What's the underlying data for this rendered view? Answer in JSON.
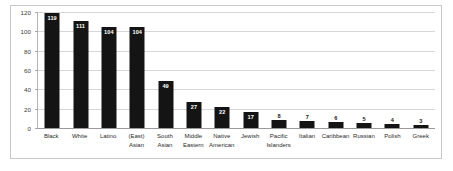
{
  "chart_data": {
    "type": "bar",
    "title": "",
    "xlabel": "",
    "ylabel": "",
    "ylim": [
      0,
      120
    ],
    "yticks": [
      0,
      20,
      40,
      60,
      80,
      100,
      120
    ],
    "grid": true,
    "legend": false,
    "orientation": "vertical",
    "bar_color": "#141414",
    "categories": [
      "Black",
      "White",
      "Latino",
      "(East) Asian",
      "South Asian",
      "Middle Eastern",
      "Native American",
      "Jewish",
      "Pacific Islanders",
      "Italian",
      "Caribbean",
      "Russian",
      "Polish",
      "Greek"
    ],
    "category_lines": [
      [
        "Black",
        ""
      ],
      [
        "White",
        ""
      ],
      [
        "Latino",
        ""
      ],
      [
        "(East)",
        "Asian"
      ],
      [
        "South",
        "Asian"
      ],
      [
        "Middle",
        "Eastern"
      ],
      [
        "Native",
        "American"
      ],
      [
        "Jewish",
        ""
      ],
      [
        "Pacific",
        "Islanders"
      ],
      [
        "Italian",
        ""
      ],
      [
        "Caribbean",
        ""
      ],
      [
        "Russian",
        ""
      ],
      [
        "Polish",
        ""
      ],
      [
        "Greek",
        ""
      ]
    ],
    "values": [
      119,
      111,
      104,
      104,
      49,
      27,
      22,
      17,
      8,
      7,
      6,
      5,
      4,
      3
    ],
    "label_placement": [
      "inside",
      "inside",
      "inside",
      "inside",
      "inside",
      "inside",
      "inside",
      "inside",
      "outside",
      "outside",
      "outside",
      "outside",
      "outside",
      "outside"
    ]
  },
  "colors": {
    "bar": "#141414",
    "gridline": "#d6d6d6",
    "axis": "#9a9a9a",
    "frame_border": "#c9c9c9",
    "tick_text": "#3a3a3a",
    "category_text": "#2b2b2b",
    "label_inside_text": "#ffffff",
    "label_outside_text": "#1a1a1a",
    "background": "#ffffff"
  }
}
